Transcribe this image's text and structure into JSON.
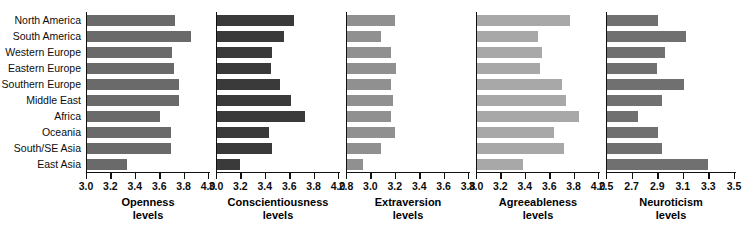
{
  "chart_data": {
    "type": "bar",
    "title": "",
    "orientation": "horizontal",
    "grid": false,
    "legend": "none",
    "categories": [
      "North America",
      "South America",
      "Western Europe",
      "Eastern Europe",
      "Southern Europe",
      "Middle East",
      "Africa",
      "Oceania",
      "South/SE Asia",
      "East Asia"
    ],
    "panels": [
      {
        "name": "openness",
        "title": "Openness",
        "subtitle": "levels",
        "xlabel": "",
        "ylabel": "",
        "xlim": [
          3.0,
          4.0
        ],
        "ticks": [
          3.0,
          3.2,
          3.4,
          3.6,
          3.8,
          4.0
        ],
        "tick_labels": [
          "3.0",
          "3.2",
          "3.4",
          "3.6",
          "3.8",
          "4.0"
        ],
        "bar_color": "#6a6a6a",
        "values": [
          3.72,
          3.85,
          3.7,
          3.71,
          3.75,
          3.75,
          3.6,
          3.69,
          3.69,
          3.33
        ]
      },
      {
        "name": "conscientiousness",
        "title": "Conscientiousness",
        "subtitle": "levels",
        "xlabel": "",
        "ylabel": "",
        "xlim": [
          3.0,
          4.0
        ],
        "ticks": [
          3.0,
          3.2,
          3.4,
          3.6,
          3.8,
          4.0
        ],
        "tick_labels": [
          "3.0",
          "3.2",
          "3.4",
          "3.6",
          "3.8",
          "4.0"
        ],
        "bar_color": "#3a3a3a",
        "values": [
          3.63,
          3.55,
          3.45,
          3.44,
          3.52,
          3.61,
          3.72,
          3.43,
          3.45,
          3.19
        ]
      },
      {
        "name": "extraversion",
        "title": "Extraversion",
        "subtitle": "levels",
        "xlabel": "",
        "ylabel": "",
        "xlim": [
          2.8,
          3.8
        ],
        "ticks": [
          2.8,
          3.0,
          3.2,
          3.4,
          3.6,
          3.8
        ],
        "tick_labels": [
          "2.8",
          "3.0",
          "3.2",
          "3.4",
          "3.6",
          "3.8"
        ],
        "bar_color": "#909090",
        "values": [
          3.19,
          3.08,
          3.16,
          3.2,
          3.16,
          3.18,
          3.16,
          3.19,
          3.08,
          2.93
        ]
      },
      {
        "name": "agreeableness",
        "title": "Agreeableness",
        "subtitle": "levels",
        "xlabel": "",
        "ylabel": "",
        "xlim": [
          3.0,
          4.0
        ],
        "ticks": [
          3.0,
          3.2,
          3.4,
          3.6,
          3.8,
          4.0
        ],
        "tick_labels": [
          "3.0",
          "3.2",
          "3.4",
          "3.6",
          "3.8",
          "4.0"
        ],
        "bar_color": "#a8a8a8",
        "values": [
          3.76,
          3.5,
          3.53,
          3.52,
          3.7,
          3.73,
          3.84,
          3.63,
          3.71,
          3.38
        ]
      },
      {
        "name": "neuroticism",
        "title": "Neuroticism",
        "subtitle": "levels",
        "xlabel": "",
        "ylabel": "",
        "xlim": [
          2.5,
          3.5
        ],
        "ticks": [
          2.5,
          2.7,
          2.9,
          3.1,
          3.3,
          3.5
        ],
        "tick_labels": [
          "2.5",
          "2.7",
          "2.9",
          "3.1",
          "3.3",
          "3.5"
        ],
        "bar_color": "#707070",
        "values": [
          2.9,
          3.12,
          2.95,
          2.89,
          3.1,
          2.93,
          2.74,
          2.9,
          2.93,
          3.29
        ]
      }
    ]
  },
  "layout": {
    "label_column_width": 86,
    "panel_lefts": [
      86,
      216,
      346,
      476,
      606
    ],
    "panel_widths": [
      124,
      124,
      124,
      124,
      130
    ],
    "axis_color": "#111111"
  }
}
